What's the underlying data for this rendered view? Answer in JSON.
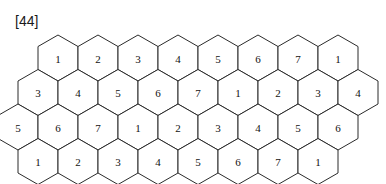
{
  "figure": {
    "label": "[44]",
    "caption": ""
  },
  "colors": {
    "background": "#ffffff",
    "stroke": "#2b2b2b",
    "cell_fill": "#ffffff",
    "text": "#111111",
    "label_text": "#1a1a1a"
  },
  "honeycomb": {
    "name": "hexagonal-cell-grid",
    "orientation": "pointy-top",
    "rows": 4,
    "hex_width": 40,
    "hex_height": 46,
    "row_vertical_step": 34.5,
    "origin_x": 38,
    "origin_y": 35,
    "row_data": [
      {
        "index": 0,
        "offset_cells": 0.5,
        "labels": [
          "1",
          "2",
          "3",
          "4",
          "5",
          "6",
          "7",
          "1"
        ]
      },
      {
        "index": 1,
        "offset_cells": 0.0,
        "labels": [
          "3",
          "4",
          "5",
          "6",
          "7",
          "1",
          "2",
          "3",
          "4"
        ]
      },
      {
        "index": 2,
        "offset_cells": -0.5,
        "labels": [
          "5",
          "6",
          "7",
          "1",
          "2",
          "3",
          "4",
          "5",
          "6"
        ]
      },
      {
        "index": 3,
        "offset_cells": 0.0,
        "labels": [
          "1",
          "2",
          "3",
          "4",
          "5",
          "6",
          "7",
          "1"
        ]
      }
    ]
  }
}
